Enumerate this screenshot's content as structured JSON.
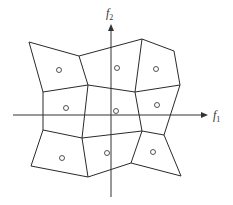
{
  "diagram": {
    "type": "voronoi-partition",
    "axes": {
      "x_label": "f",
      "x_sub": "1",
      "y_label": "f",
      "y_sub": "2"
    },
    "cell_count": 9,
    "colors": {
      "line": "#2a2a2a",
      "background": "#ffffff"
    }
  }
}
